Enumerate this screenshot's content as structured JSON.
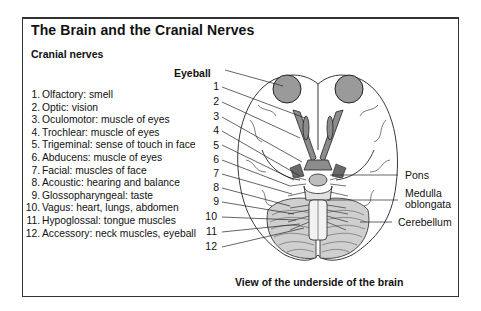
{
  "title": "The Brain and the Cranial Nerves",
  "subtitle": "Cranial nerves",
  "nerves": [
    {
      "num": "1.",
      "text": "Olfactory: smell"
    },
    {
      "num": "2.",
      "text": "Optic: vision"
    },
    {
      "num": "3.",
      "text": "Oculomotor: muscle of eyes"
    },
    {
      "num": "4.",
      "text": "Trochlear: muscle of eyes"
    },
    {
      "num": "5.",
      "text": "Trigeminal: sense of touch in face"
    },
    {
      "num": "6.",
      "text": "Abducens: muscle of eyes"
    },
    {
      "num": "7.",
      "text": "Facial: muscles of face"
    },
    {
      "num": "8.",
      "text": "Acoustic: hearing and balance"
    },
    {
      "num": "9.",
      "text": "Glossopharyngeal: taste"
    },
    {
      "num": "10.",
      "text": "Vagus: heart, lungs, abdomen"
    },
    {
      "num": "11.",
      "text": "Hypoglossal: tongue muscles"
    },
    {
      "num": "12.",
      "text": "Accessory: neck muscles, eyeball"
    }
  ],
  "diagram": {
    "eyeball_label": "Eyeball",
    "number_labels": [
      "1",
      "2",
      "3",
      "4",
      "5",
      "6",
      "7",
      "8",
      "9",
      "10",
      "11",
      "12"
    ],
    "right_labels": {
      "pons": "Pons",
      "medulla_line1": "Medulla",
      "medulla_line2": "oblongata",
      "cerebellum": "Cerebellum"
    },
    "colors": {
      "line": "#222222",
      "eye_fill": "#9a9a9a",
      "nerve_fill": "#8c8c8c",
      "stem_fill": "#f2f2f2"
    }
  },
  "caption": "View of the underside of the brain"
}
